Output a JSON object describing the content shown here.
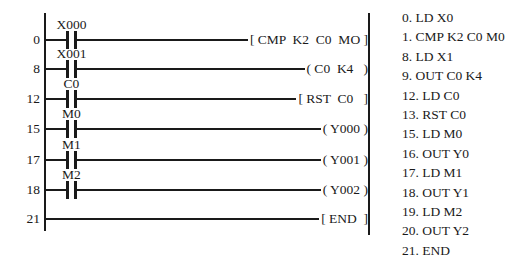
{
  "figure": {
    "colors": {
      "ink": "#1a1a1a",
      "background": "#ffffff"
    },
    "ladder": {
      "rungs": [
        {
          "step": "0",
          "contact": "X000",
          "output": "[ CMP  K2  C0  MO ]"
        },
        {
          "step": "8",
          "contact": "X001",
          "output": "( C0  K4   )"
        },
        {
          "step": "12",
          "contact": "C0",
          "output": "[ RST  C0   ]"
        },
        {
          "step": "15",
          "contact": "M0",
          "output": "( Y000 )"
        },
        {
          "step": "17",
          "contact": "M1",
          "output": "( Y001 )"
        },
        {
          "step": "18",
          "contact": "M2",
          "output": "( Y002 )"
        },
        {
          "step": "21",
          "contact": "",
          "output": "[ END  ]"
        }
      ]
    },
    "instruction_list": {
      "lines": [
        "0. LD X0",
        "1. CMP K2 C0 M0",
        "8. LD X1",
        "9. OUT C0 K4",
        "12. LD C0",
        "13. RST C0",
        "15. LD M0",
        "16. OUT Y0",
        "17. LD M1",
        "18. OUT Y1",
        "19. LD M2",
        "20. OUT Y2",
        "21. END"
      ]
    }
  }
}
